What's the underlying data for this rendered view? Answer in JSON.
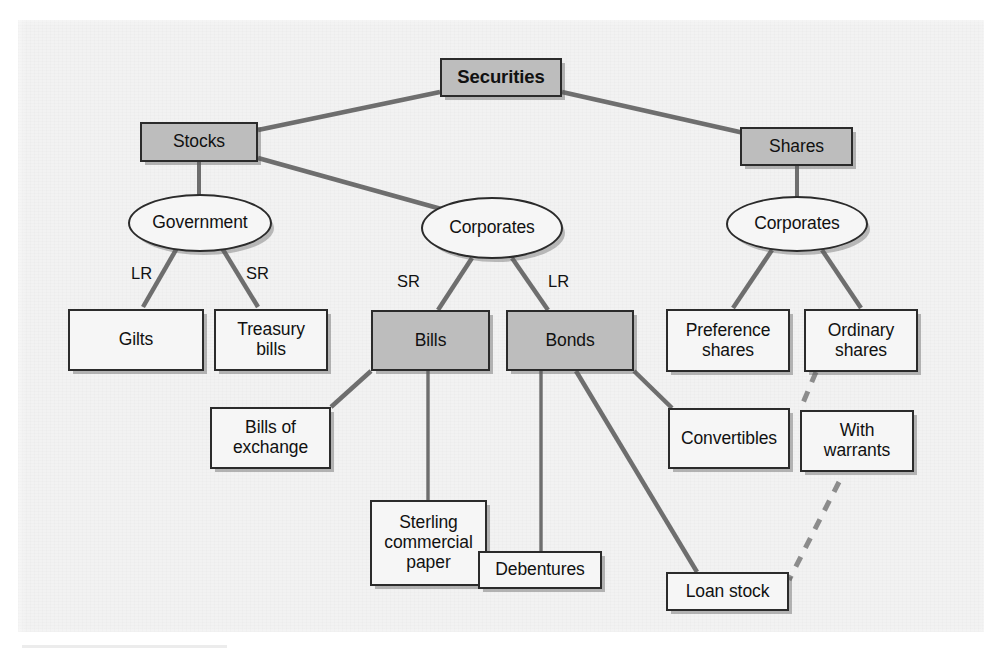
{
  "figure": {
    "colors": {
      "page_background": "#ffffff",
      "panel_background": "#f2f2f2",
      "node_fill_white": "#f6f6f6",
      "node_fill_gray": "#bdbdbd",
      "node_border": "#2b2b2b",
      "connector": "#6e6e6e",
      "text": "#111111"
    }
  },
  "nodes": {
    "securities": {
      "label": "Securities",
      "shape": "rectangle",
      "fill": "gray",
      "bold": true
    },
    "stocks": {
      "label": "Stocks",
      "shape": "rectangle",
      "fill": "gray"
    },
    "shares": {
      "label": "Shares",
      "shape": "rectangle",
      "fill": "gray"
    },
    "government": {
      "label": "Government",
      "shape": "ellipse",
      "fill": "white"
    },
    "corporates_stocks": {
      "label": "Corporates",
      "shape": "ellipse",
      "fill": "white"
    },
    "corporates_shares": {
      "label": "Corporates",
      "shape": "ellipse",
      "fill": "white"
    },
    "gilts": {
      "label": "Gilts",
      "shape": "rectangle",
      "fill": "white"
    },
    "treasury_bills": {
      "label": "Treasury bills",
      "line1": "Treasury",
      "line2": "bills",
      "shape": "rectangle",
      "fill": "white"
    },
    "bills": {
      "label": "Bills",
      "shape": "rectangle",
      "fill": "gray"
    },
    "bonds": {
      "label": "Bonds",
      "shape": "rectangle",
      "fill": "gray"
    },
    "preference_shares": {
      "label": "Preference shares",
      "line1": "Preference",
      "line2": "shares",
      "shape": "rectangle",
      "fill": "white"
    },
    "ordinary_shares": {
      "label": "Ordinary shares",
      "line1": "Ordinary",
      "line2": "shares",
      "shape": "rectangle",
      "fill": "white"
    },
    "bills_of_exchange": {
      "label": "Bills of exchange",
      "line1": "Bills of",
      "line2": "exchange",
      "shape": "rectangle",
      "fill": "white"
    },
    "sterling_commercial_paper": {
      "label": "Sterling commercial paper",
      "line1": "Sterling",
      "line2": "commercial",
      "line3": "paper",
      "shape": "rectangle",
      "fill": "white"
    },
    "debentures": {
      "label": "Debentures",
      "shape": "rectangle",
      "fill": "white"
    },
    "loan_stock": {
      "label": "Loan stock",
      "shape": "rectangle",
      "fill": "white"
    },
    "convertibles": {
      "label": "Convertibles",
      "shape": "rectangle",
      "fill": "white"
    },
    "with_warrants": {
      "label": "With warrants",
      "line1": "With",
      "line2": "warrants",
      "shape": "rectangle",
      "fill": "white"
    }
  },
  "edge_labels": {
    "government_lr": "LR",
    "government_sr": "SR",
    "corporates_sr": "SR",
    "corporates_lr": "LR"
  },
  "edges": [
    {
      "from": "securities",
      "to": "stocks",
      "style": "solid"
    },
    {
      "from": "securities",
      "to": "shares",
      "style": "solid"
    },
    {
      "from": "stocks",
      "to": "government",
      "style": "solid"
    },
    {
      "from": "stocks",
      "to": "corporates_stocks",
      "style": "solid"
    },
    {
      "from": "shares",
      "to": "corporates_shares",
      "style": "solid"
    },
    {
      "from": "government",
      "to": "gilts",
      "style": "solid",
      "label": "LR"
    },
    {
      "from": "government",
      "to": "treasury_bills",
      "style": "solid",
      "label": "SR"
    },
    {
      "from": "corporates_stocks",
      "to": "bills",
      "style": "solid",
      "label": "SR"
    },
    {
      "from": "corporates_stocks",
      "to": "bonds",
      "style": "solid",
      "label": "LR"
    },
    {
      "from": "corporates_shares",
      "to": "preference_shares",
      "style": "solid"
    },
    {
      "from": "corporates_shares",
      "to": "ordinary_shares",
      "style": "solid"
    },
    {
      "from": "bills",
      "to": "bills_of_exchange",
      "style": "solid"
    },
    {
      "from": "bills",
      "to": "sterling_commercial_paper",
      "style": "solid"
    },
    {
      "from": "bonds",
      "to": "debentures",
      "style": "solid"
    },
    {
      "from": "bonds",
      "to": "loan_stock",
      "style": "solid"
    },
    {
      "from": "bonds",
      "to": "convertibles",
      "style": "solid"
    },
    {
      "from": "ordinary_shares",
      "to": "with_warrants",
      "style": "dashed"
    },
    {
      "from": "with_warrants",
      "to": "loan_stock",
      "style": "dashed"
    }
  ]
}
